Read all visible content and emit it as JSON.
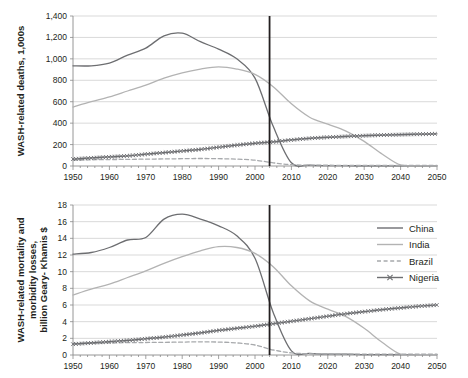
{
  "figure": {
    "title": "",
    "background": "#ffffff",
    "width": 468,
    "height": 378
  },
  "legend": {
    "position": "middle-right",
    "entries": [
      {
        "label": "China",
        "color": "#6d6e71",
        "style": "solid",
        "marker": "none"
      },
      {
        "label": "India",
        "color": "#b3b3b3",
        "style": "solid",
        "marker": "none"
      },
      {
        "label": "Brazil",
        "color": "#a7a9ac",
        "style": "dashed",
        "marker": "none"
      },
      {
        "label": "Nigeria",
        "color": "#6d6e71",
        "style": "solid",
        "marker": "x"
      }
    ]
  },
  "chart_data": [
    {
      "type": "line",
      "id": "top-panel",
      "title": "",
      "xlabel": "",
      "ylabel": "WASH-related deaths, 1,000s",
      "xlim": [
        1950,
        2050
      ],
      "ylim": [
        0,
        1400
      ],
      "xticks": [
        1950,
        1960,
        1970,
        1980,
        1990,
        2000,
        2010,
        2020,
        2030,
        2040,
        2050
      ],
      "yticks": [
        0,
        200,
        400,
        600,
        800,
        1000,
        1200,
        1400
      ],
      "ytick_labels": [
        "0",
        "200",
        "400",
        "600",
        "800",
        "1,000",
        "1,200",
        "1,400"
      ],
      "grid": true,
      "annotations": [
        {
          "type": "vline",
          "x": 2004,
          "color": "#231f20",
          "label": ""
        }
      ],
      "x": [
        1950,
        1955,
        1960,
        1965,
        1970,
        1975,
        1980,
        1985,
        1990,
        1995,
        2000,
        2005,
        2010,
        2015,
        2020,
        2025,
        2030,
        2035,
        2040,
        2045,
        2050
      ],
      "series": [
        {
          "name": "China",
          "color": "#6d6e71",
          "style": "solid",
          "values": [
            935,
            935,
            960,
            1035,
            1100,
            1215,
            1240,
            1160,
            1090,
            1000,
            820,
            370,
            30,
            8,
            4,
            3,
            2,
            2,
            2,
            2,
            2
          ]
        },
        {
          "name": "India",
          "color": "#b3b3b3",
          "style": "solid",
          "values": [
            550,
            600,
            645,
            700,
            755,
            820,
            870,
            905,
            925,
            905,
            855,
            740,
            580,
            455,
            390,
            325,
            230,
            110,
            10,
            3,
            2
          ]
        },
        {
          "name": "Brazil",
          "color": "#a7a9ac",
          "style": "dashed",
          "values": [
            55,
            58,
            60,
            62,
            64,
            66,
            68,
            70,
            68,
            64,
            54,
            30,
            12,
            8,
            7,
            6,
            6,
            6,
            6,
            6,
            6
          ]
        },
        {
          "name": "Nigeria",
          "color": "#6d6e71",
          "style": "solid",
          "marker": "x",
          "values": [
            65,
            75,
            85,
            95,
            110,
            125,
            140,
            155,
            175,
            195,
            212,
            225,
            243,
            258,
            268,
            276,
            283,
            289,
            293,
            297,
            300
          ]
        }
      ]
    },
    {
      "type": "line",
      "id": "bottom-panel",
      "title": "",
      "xlabel": "",
      "ylabel": "WASH-related mortality and morbidity losses, billion Geary- Khamis $",
      "xlim": [
        1950,
        2050
      ],
      "ylim": [
        0,
        18
      ],
      "xticks": [
        1950,
        1960,
        1970,
        1980,
        1990,
        2000,
        2010,
        2020,
        2030,
        2040,
        2050
      ],
      "yticks": [
        0,
        2,
        4,
        6,
        8,
        10,
        12,
        14,
        16,
        18
      ],
      "ytick_labels": [
        "0",
        "2",
        "4",
        "6",
        "8",
        "10",
        "12",
        "14",
        "16",
        "18"
      ],
      "grid": true,
      "annotations": [
        {
          "type": "vline",
          "x": 2004,
          "color": "#231f20",
          "label": ""
        }
      ],
      "x": [
        1950,
        1955,
        1960,
        1965,
        1970,
        1975,
        1980,
        1985,
        1990,
        1995,
        2000,
        2005,
        2010,
        2015,
        2020,
        2025,
        2030,
        2035,
        2040,
        2045,
        2050
      ],
      "series": [
        {
          "name": "China",
          "color": "#6d6e71",
          "style": "solid",
          "values": [
            12.1,
            12.3,
            12.9,
            13.8,
            14.1,
            16.3,
            16.9,
            16.3,
            15.5,
            14.3,
            11.6,
            5.1,
            0.5,
            0.2,
            0.1,
            0.1,
            0.05,
            0.05,
            0.05,
            0.05,
            0.05
          ]
        },
        {
          "name": "India",
          "color": "#b3b3b3",
          "style": "solid",
          "values": [
            7.2,
            7.9,
            8.5,
            9.3,
            10.1,
            11.0,
            11.8,
            12.5,
            13.0,
            12.9,
            12.2,
            10.6,
            8.3,
            6.5,
            5.5,
            4.6,
            3.2,
            1.5,
            0.1,
            0.05,
            0.05
          ]
        },
        {
          "name": "Brazil",
          "color": "#a7a9ac",
          "style": "dashed",
          "values": [
            1.4,
            1.42,
            1.45,
            1.48,
            1.5,
            1.52,
            1.55,
            1.58,
            1.55,
            1.45,
            1.2,
            0.6,
            0.25,
            0.15,
            0.12,
            0.1,
            0.1,
            0.1,
            0.1,
            0.1,
            0.1
          ]
        },
        {
          "name": "Nigeria",
          "color": "#6d6e71",
          "style": "solid",
          "marker": "x",
          "values": [
            1.3,
            1.45,
            1.6,
            1.75,
            1.95,
            2.15,
            2.4,
            2.65,
            2.95,
            3.2,
            3.45,
            3.75,
            4.05,
            4.35,
            4.65,
            4.95,
            5.2,
            5.45,
            5.65,
            5.85,
            6.0
          ]
        }
      ]
    }
  ]
}
